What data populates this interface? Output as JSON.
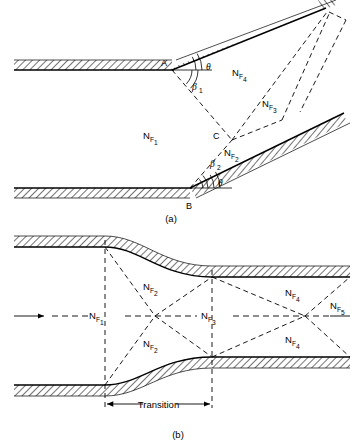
{
  "figure": {
    "title_implicit": "Supersonic flow regions in a converging duct and a transition section",
    "background_color": "#ffffff",
    "line_color": "#000000",
    "panels": [
      {
        "id": "a",
        "caption": "(a)",
        "description": "Wedge/ramp compression with oblique shocks emanating from points A and B",
        "points": [
          {
            "name": "A",
            "label": "A"
          },
          {
            "name": "B",
            "label": "B"
          },
          {
            "name": "C",
            "label": "C"
          }
        ],
        "angles": [
          {
            "name": "theta-upper",
            "label": "θ"
          },
          {
            "name": "beta-1",
            "label": "β",
            "sub": "1"
          },
          {
            "name": "beta-2",
            "label": "β",
            "sub": "2"
          },
          {
            "name": "theta-lower",
            "label": "θ"
          }
        ],
        "regions": [
          {
            "name": "region-nf1",
            "label": "N",
            "sub": "F",
            "sub2": "1"
          },
          {
            "name": "region-nf2",
            "label": "N",
            "sub": "F",
            "sub2": "2"
          },
          {
            "name": "region-nf3",
            "label": "N",
            "sub": "F",
            "sub2": "3"
          },
          {
            "name": "region-nf4",
            "label": "N",
            "sub": "F",
            "sub2": "4"
          }
        ]
      },
      {
        "id": "b",
        "caption": "(b)",
        "description": "Duct transition section showing successive Mach-number regions along the centerline",
        "dimension_label": "Transition",
        "flow_arrow": "flow-direction-arrow",
        "regions": [
          {
            "name": "region-nf1",
            "label": "N",
            "sub": "F",
            "sub2": "1"
          },
          {
            "name": "region-nf2-upper",
            "label": "N",
            "sub": "F",
            "sub2": "2"
          },
          {
            "name": "region-nf2-lower",
            "label": "N",
            "sub": "F",
            "sub2": "2"
          },
          {
            "name": "region-nf3",
            "label": "N",
            "sub": "F",
            "sub2": "3"
          },
          {
            "name": "region-nf4-upper",
            "label": "N",
            "sub": "F",
            "sub2": "4"
          },
          {
            "name": "region-nf4-lower",
            "label": "N",
            "sub": "F",
            "sub2": "4"
          },
          {
            "name": "region-nf5",
            "label": "N",
            "sub": "F",
            "sub2": "5"
          }
        ]
      }
    ]
  }
}
